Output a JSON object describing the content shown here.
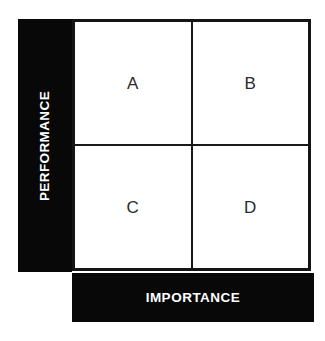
{
  "diagram": {
    "type": "2x2-matrix",
    "name": "Importance-Performance Matrix",
    "background_color": "#ffffff",
    "bar_color": "#080808",
    "border_color": "#141414",
    "label_color": "#2b2b2b",
    "axis_text_color": "#ffffff"
  },
  "axes": {
    "vertical": {
      "label": "PERFORMANCE",
      "orientation": "bottom-to-top"
    },
    "horizontal": {
      "label": "IMPORTANCE",
      "orientation": "left-to-right"
    }
  },
  "quadrants": [
    {
      "id": "q-a",
      "label": "A",
      "position": "top-left"
    },
    {
      "id": "q-b",
      "label": "B",
      "position": "top-right"
    },
    {
      "id": "q-c",
      "label": "C",
      "position": "bottom-left"
    },
    {
      "id": "q-d",
      "label": "D",
      "position": "bottom-right"
    }
  ]
}
